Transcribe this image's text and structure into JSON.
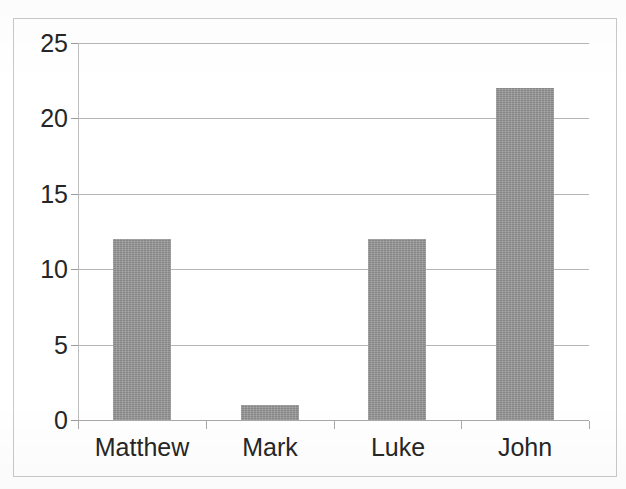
{
  "chart_data": {
    "type": "bar",
    "title": "",
    "subtitle": "",
    "xlabel": "",
    "ylabel": "",
    "categories": [
      "Matthew",
      "Mark",
      "Luke",
      "John"
    ],
    "values": [
      12,
      1,
      12,
      22
    ],
    "series": [
      {
        "name": "",
        "values": [
          12,
          1,
          12,
          22
        ]
      }
    ],
    "ylim": [
      0,
      25
    ],
    "yticks": [
      0,
      5,
      10,
      15,
      20,
      25
    ],
    "ytick_labels": [
      "0",
      "5",
      "10",
      "15",
      "20",
      "25"
    ],
    "xtick_labels": [
      "Matthew",
      "Mark",
      "Luke",
      "John"
    ],
    "grid": true,
    "grid_axis": "y",
    "legend": false,
    "legend_position": "none",
    "annotations": [],
    "colors": {
      "bar_fill": "#969696",
      "gridline": "#b5b5b5",
      "axis": "#bdbdbd",
      "text": "#262626",
      "background": "#ffffff",
      "frame": "#c9c9c9"
    }
  }
}
